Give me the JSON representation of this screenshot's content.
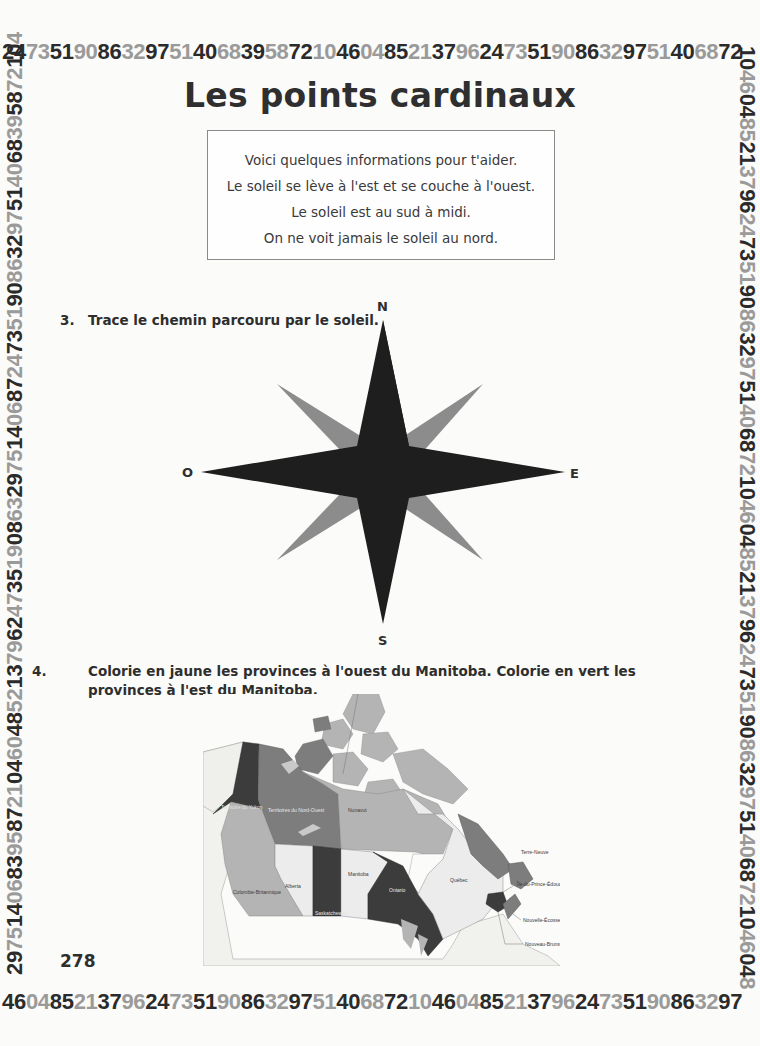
{
  "page": {
    "title": "Les points cardinaux",
    "page_number": "278"
  },
  "border_digits": {
    "top": "24735190863297514068395872104604852137962473519086329751406872",
    "bottom": "4604852137962473519086329751406872104604852137962473519086329 7",
    "left": "2975140683958721046048521379624735190863297514068724735190863297514068395872104",
    "right": "104604852137962473519086329751406872104604852137962473519086329751406872104604 8",
    "dark_color": "#2b2b2b",
    "light_color": "#9a9a9a"
  },
  "info_box": {
    "lines": [
      "Voici quelques informations pour t'aider.",
      "Le soleil se lève à l'est et se couche à l'ouest.",
      "Le soleil est au sud à midi.",
      "On ne voit jamais le soleil au nord."
    ]
  },
  "questions": [
    {
      "number": "3.",
      "text": "Trace le chemin parcouru par le soleil."
    },
    {
      "number": "4.",
      "text": "Colorie en jaune les provinces à l'ouest du Manitoba. Colorie en vert les provinces à l'est du Manitoba."
    }
  ],
  "compass": {
    "north": "N",
    "south": "S",
    "east": "E",
    "west": "O",
    "main_color": "#1e1e1e",
    "secondary_color": "#8c8c8c"
  },
  "map": {
    "labels": {
      "yukon": "Territoire du Yukon",
      "nwt": "Territoires du Nord-Ouest",
      "nunavut": "Nunavut",
      "bc": "Colombie-Britannique",
      "alberta": "Alberta",
      "saskatchewan": "Saskatchewan",
      "manitoba": "Manitoba",
      "ontario": "Ontario",
      "quebec": "Québec",
      "newfoundland": "Terre-Neuve",
      "pei": "Île-du-Prince-Édouard",
      "nova_scotia": "Nouvelle-Écosse",
      "new_brunswick": "Nouveau-Brunswick"
    },
    "colors": {
      "dark": "#3c3c3c",
      "medium": "#7d7d7d",
      "light": "#b4b4b4",
      "pale": "#ececec",
      "usa": "#f4f4f2"
    }
  }
}
